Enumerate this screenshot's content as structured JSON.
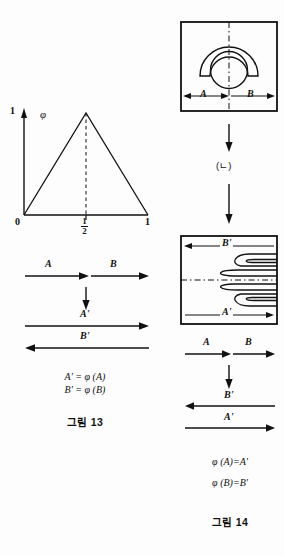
{
  "figure13": {
    "caption": "그림 13",
    "plot": {
      "y_top_label": "1",
      "function_symbol": "φ",
      "x_origin_label": "0",
      "x_mid_numerator": "1",
      "x_mid_denominator": "2",
      "x_end_label": "1",
      "curve_type": "tent map",
      "peak_x": 0.5,
      "peak_y": 1
    },
    "arrow_diagram": {
      "top_left_label": "A",
      "top_right_label": "B",
      "middle_arrow": "down",
      "result_first_label": "A'",
      "result_first_direction": "right",
      "result_second_label": "B'",
      "result_second_direction": "left"
    },
    "equations": [
      "A' = φ (A)",
      "B' = φ (B)"
    ]
  },
  "figure14": {
    "caption": "그림 14",
    "step_label": "(ㄴ)",
    "top_box": {
      "left_label": "A",
      "right_label": "B",
      "shape": "circle-with-arch",
      "center_line": "dash-dot vertical"
    },
    "bottom_box": {
      "top_label": "B'",
      "top_direction": "left",
      "bottom_label": "A'",
      "bottom_direction": "right",
      "shape": "folded horseshoe lobes",
      "center_line": "dash-dot horizontal"
    },
    "arrow_diagram": {
      "top_left_label": "A",
      "top_right_label": "B",
      "middle_arrow": "down",
      "result_first_label": "B'",
      "result_first_direction": "left",
      "result_second_label": "A'",
      "result_second_direction": "right"
    },
    "equations": [
      "φ (A)=A'",
      "φ (B)=B'"
    ]
  },
  "colors": {
    "ink": "#111111",
    "background": "#fdfdfd"
  }
}
